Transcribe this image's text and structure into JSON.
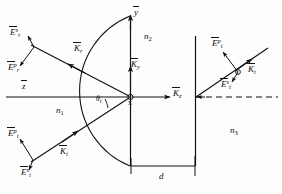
{
  "figure": {
    "type": "optics-ray-diagram",
    "width": 282,
    "height": 194,
    "background": "#fdfdfd",
    "line_color": "#111111"
  },
  "axes": {
    "y_axis_label": "y",
    "z_axis_label": "z",
    "origin_label": "x",
    "k_y_label": "K",
    "k_y_sub": "y",
    "k_z_label": "K",
    "k_z_sub": "z"
  },
  "media": {
    "region_1": {
      "label": "n",
      "sub": "1"
    },
    "region_2": {
      "label": "n",
      "sub": "2"
    },
    "region_3": {
      "label": "n",
      "sub": "3"
    }
  },
  "angle": {
    "label": "θ",
    "sub": "i"
  },
  "thickness": {
    "label": "d"
  },
  "vectors": {
    "k_incident": {
      "label": "K",
      "sub": "i"
    },
    "k_reflected": {
      "label": "K",
      "sub": "r"
    },
    "k_transmitted": {
      "label": "K",
      "sub": "t"
    }
  },
  "fields": {
    "incident_p": {
      "label": "E",
      "sup": "p",
      "sub": "i"
    },
    "incident_s": {
      "label": "E",
      "sup": "s",
      "sub": "i"
    },
    "reflected_p": {
      "label": "E",
      "sup": "p",
      "sub": "r"
    },
    "reflected_s": {
      "label": "E",
      "sup": "s",
      "sub": "r"
    },
    "transmitted_p": {
      "label": "E",
      "sup": "p",
      "sub": "t"
    },
    "transmitted_s": {
      "label": "E",
      "sup": "s",
      "sub": "t"
    }
  }
}
